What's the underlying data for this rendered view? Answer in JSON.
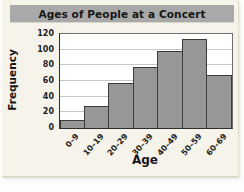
{
  "figure": {
    "title": "Ages of People at a Concert"
  },
  "chart_data": {
    "type": "bar",
    "subtype": "histogram",
    "title": "Ages of People at a Concert",
    "categories": [
      "0–9",
      "10–19",
      "20–29",
      "30–39",
      "40–49",
      "50–59",
      "60–69"
    ],
    "values": [
      10,
      28,
      58,
      78,
      98,
      113,
      68
    ],
    "xlabel": "Age",
    "ylabel": "Frequency",
    "ylim": [
      0,
      120
    ],
    "yticks": [
      0,
      20,
      40,
      60,
      80,
      100,
      120
    ],
    "grid": true,
    "legend": "none",
    "bars_touching": true
  },
  "colors": {
    "card_background": "#f6f3ea",
    "title_bar_background": "#a9a9a9",
    "plot_background": "#ffffff",
    "bar_fill": "#979797",
    "bar_border": "#3c3c3c",
    "gridline": "#c6c6c6",
    "text": "#161616"
  }
}
